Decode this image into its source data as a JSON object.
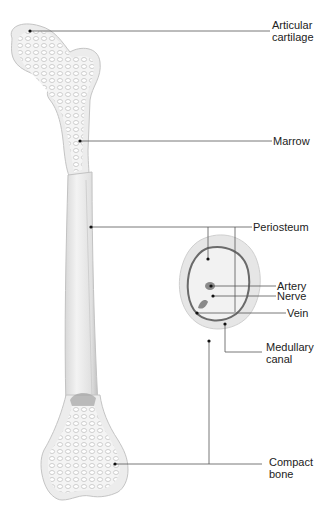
{
  "labels": {
    "articular_cartilage": [
      "Articular",
      "cartilage"
    ],
    "marrow": "Marrow",
    "periosteum": "Periosteum",
    "artery": "Artery",
    "nerve": "Nerve",
    "vein": "Vein",
    "medullary_canal": [
      "Medullary",
      "canal"
    ],
    "compact_bone": [
      "Compact",
      "bone"
    ]
  },
  "colors": {
    "bone": "#ebebeb",
    "bone_shadow": "#c9c9c9",
    "line": "#555555",
    "text": "#222222"
  }
}
